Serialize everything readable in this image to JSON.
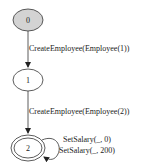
{
  "diagram": {
    "type": "state-machine",
    "nodes": [
      {
        "id": "0",
        "label": "0",
        "initial": true,
        "accepting": false,
        "fill": "#d3d3d3"
      },
      {
        "id": "1",
        "label": "1",
        "initial": false,
        "accepting": false,
        "fill": "#ffffff"
      },
      {
        "id": "2",
        "label": "2",
        "initial": false,
        "accepting": true,
        "fill": "#ffffff"
      }
    ],
    "edges": [
      {
        "from": "0",
        "to": "1",
        "label": "CreateEmployee(Employee(1))"
      },
      {
        "from": "1",
        "to": "2",
        "label": "CreateEmployee(Employee(2))"
      },
      {
        "from": "2",
        "to": "2",
        "label": "SetSalary(_, 0)"
      },
      {
        "from": "2",
        "to": "2",
        "label": "SetSalary(_, 200)"
      }
    ]
  }
}
